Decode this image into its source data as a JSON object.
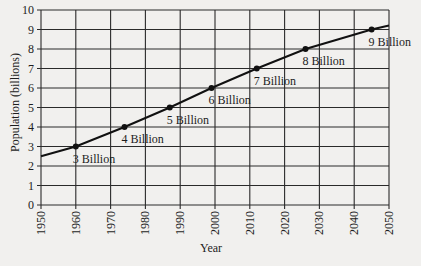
{
  "chart_data": {
    "type": "line",
    "title": "",
    "xlabel": "Year",
    "ylabel": "Population (billions)",
    "xlim": [
      1950,
      2050
    ],
    "ylim": [
      0,
      10
    ],
    "grid": true,
    "legend": null,
    "x_ticks": [
      1950,
      1960,
      1970,
      1980,
      1990,
      2000,
      2010,
      2020,
      2030,
      2040,
      2050
    ],
    "y_ticks": [
      0,
      1,
      2,
      3,
      4,
      5,
      6,
      7,
      8,
      9,
      10
    ],
    "series": [
      {
        "name": "World population",
        "x": [
          1950,
          1960,
          1974,
          1987,
          1999,
          2012,
          2026,
          2045,
          2050
        ],
        "y": [
          2.5,
          3,
          4,
          5,
          6,
          7,
          8,
          9,
          9.2
        ]
      }
    ],
    "markers": [
      {
        "year": 1960,
        "value": 3,
        "label": "3 Billion"
      },
      {
        "year": 1974,
        "value": 4,
        "label": "4 Billion"
      },
      {
        "year": 1987,
        "value": 5,
        "label": "5 Billion"
      },
      {
        "year": 1999,
        "value": 6,
        "label": "6 Billion"
      },
      {
        "year": 2012,
        "value": 7,
        "label": "7 Billion"
      },
      {
        "year": 2026,
        "value": 8,
        "label": "8 Billion"
      },
      {
        "year": 2045,
        "value": 9,
        "label": "9 Billion"
      }
    ]
  }
}
